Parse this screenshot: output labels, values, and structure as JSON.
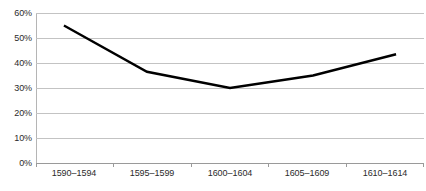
{
  "chart_data": {
    "type": "line",
    "title": "",
    "subtitle": "",
    "xlabel": "",
    "ylabel": "",
    "categories": [
      "1590–1594",
      "1595–1599",
      "1600–1604",
      "1605–1609",
      "1610–1614"
    ],
    "values": [
      55,
      36.5,
      30,
      35,
      43.5
    ],
    "series": [
      {
        "name": "",
        "values": [
          55,
          36.5,
          30,
          35,
          43.5
        ]
      }
    ],
    "y_ticks": [
      0,
      10,
      20,
      30,
      40,
      50,
      60
    ],
    "y_tick_labels": [
      "0%",
      "10%",
      "20%",
      "30%",
      "40%",
      "50%",
      "60%"
    ],
    "ylim": [
      0,
      60
    ],
    "grid": true,
    "legend": "none",
    "line_color": "#000000",
    "grid_color": "#c3c3c3",
    "axis_color": "#9a9a9a",
    "background_color": "#ffffff",
    "markers": false
  }
}
